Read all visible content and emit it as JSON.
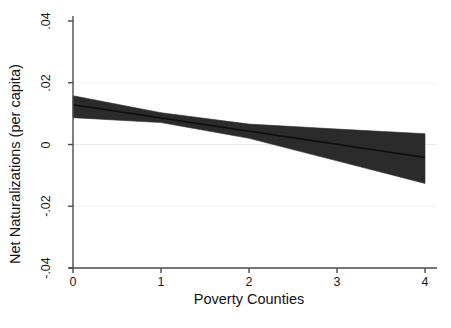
{
  "chart_data": {
    "type": "line",
    "title": "",
    "subtitle": "",
    "xlabel": "Poverty Counties",
    "ylabel": "Net Naturalizations (per capita)",
    "xlim": [
      0,
      4
    ],
    "ylim": [
      -0.04,
      0.04
    ],
    "xticks": [
      "0",
      "1",
      "2",
      "3",
      "4"
    ],
    "xtick_values": [
      0,
      1,
      2,
      3,
      4
    ],
    "yticks": [
      "-.04",
      "-.02",
      "0",
      ".02",
      ".04"
    ],
    "ytick_values": [
      -0.04,
      -0.02,
      0,
      0.02,
      0.04
    ],
    "grid": "horizontal-faint",
    "legend": "none",
    "zero_reference_line": 0,
    "x": [
      0,
      1,
      2,
      3,
      4
    ],
    "series": [
      {
        "name": "Fitted marginal effect",
        "style": "line",
        "color": "#1a1a1a",
        "values": [
          0.0129,
          0.0086,
          0.0043,
          0.0001,
          -0.0042
        ]
      },
      {
        "name": "Confidence interval upper",
        "style": "band-edge",
        "color": "#2b2b2b",
        "values": [
          0.0158,
          0.0103,
          0.0066,
          0.005,
          0.0035
        ]
      },
      {
        "name": "Confidence interval lower",
        "style": "band-edge",
        "color": "#2b2b2b",
        "values": [
          0.0087,
          0.0071,
          0.002,
          -0.0053,
          -0.0126
        ]
      }
    ],
    "band_fill_color": "#2b2b2b",
    "axis_color": "#4a4a4a",
    "background_color": "#ffffff"
  }
}
